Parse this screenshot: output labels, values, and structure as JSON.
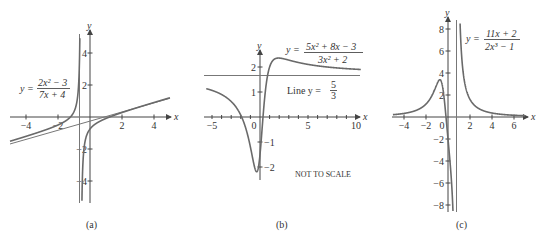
{
  "chart_data": [
    {
      "id": "a",
      "type": "line",
      "caption": "(a)",
      "equation": {
        "lhs": "y =",
        "numerator": "2x² − 3",
        "denominator": "7x + 4"
      },
      "xlabel": "x",
      "ylabel": "y",
      "x_ticks": [
        "−4",
        "−2",
        "2",
        "4"
      ],
      "y_ticks": [
        "4",
        "2",
        "−2",
        "−4"
      ],
      "xlim": [
        -5,
        5
      ],
      "ylim": [
        -5.3,
        5.3
      ],
      "vertical_asymptote": -0.5714,
      "oblique_asymptote": "y = (2/7)x − 8/49",
      "series": [
        {
          "name": "y = (2x^2-3)/(7x+4)",
          "function": "(2*x*x-3)/(7*x+4)"
        }
      ]
    },
    {
      "id": "b",
      "type": "line",
      "caption": "(b)",
      "equation": {
        "lhs": "y =",
        "numerator": "5x² + 8x − 3",
        "denominator": "3x² + 2"
      },
      "line_label": {
        "prefix": "Line y =",
        "numerator": "5",
        "denominator": "3"
      },
      "note": "NOT TO SCALE",
      "xlabel": "x",
      "ylabel": "y",
      "x_ticks": [
        "−5",
        "0",
        "5",
        "10"
      ],
      "y_ticks": [
        "2",
        "1",
        "−1",
        "−2"
      ],
      "xlim": [
        -5.5,
        10.5
      ],
      "ylim": [
        -2.3,
        2.6
      ],
      "horizontal_asymptote": 1.6667,
      "series": [
        {
          "name": "y = (5x^2+8x-3)/(3x^2+2)",
          "function": "(5*x*x+8*x-3)/(3*x*x+2)"
        }
      ]
    },
    {
      "id": "c",
      "type": "line",
      "caption": "(c)",
      "equation": {
        "lhs": "y =",
        "numerator": "11x + 2",
        "denominator": "2x³ − 1"
      },
      "xlabel": "x",
      "ylabel": "y",
      "x_ticks": [
        "−4",
        "−2",
        "0",
        "2",
        "4",
        "6"
      ],
      "y_ticks": [
        "8",
        "6",
        "4",
        "2",
        "−2",
        "−4",
        "−6",
        "−8"
      ],
      "xlim": [
        -5,
        7
      ],
      "ylim": [
        -8.8,
        8.8
      ],
      "vertical_asymptote": 0.7937,
      "series": [
        {
          "name": "y = (11x+2)/(2x^3-1)",
          "function": "(11*x+2)/(2*x*x*x-1)"
        }
      ]
    }
  ]
}
